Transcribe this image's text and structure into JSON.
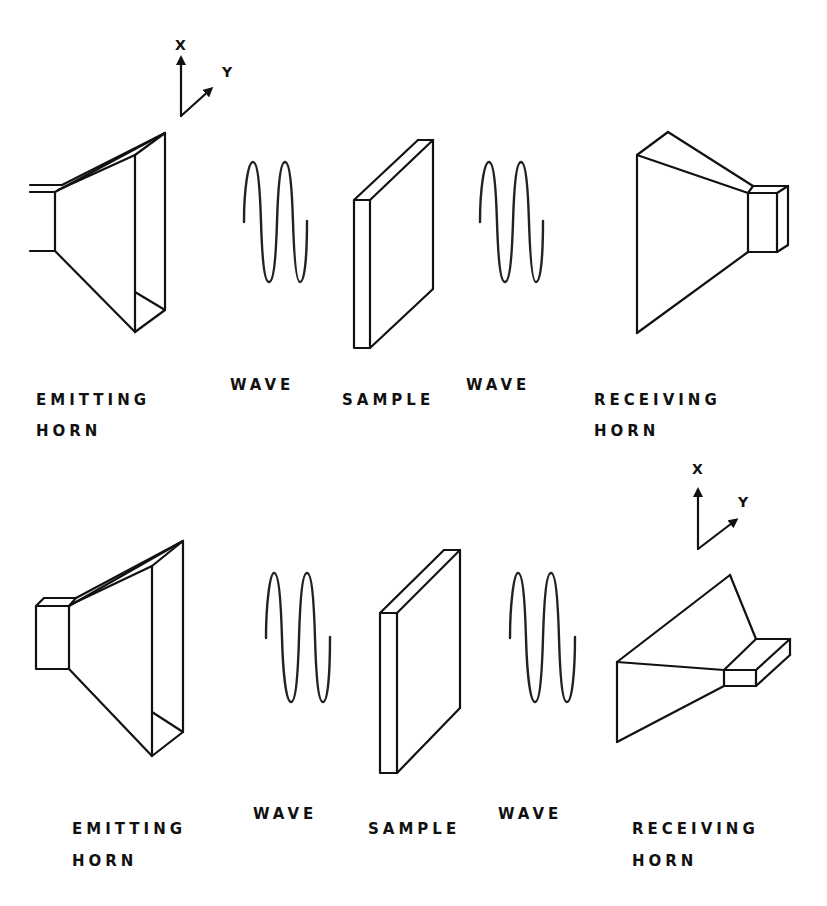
{
  "diagram": {
    "panels": [
      {
        "id": "top",
        "axis": {
          "x_label": "X",
          "y_label": "Y"
        },
        "labels": {
          "emitting_line1": "EMITTING",
          "emitting_line2": "HORN",
          "wave_left": "WAVE",
          "sample": "SAMPLE",
          "wave_right": "WAVE",
          "receiving_line1": "RECEIVING",
          "receiving_line2": "HORN"
        }
      },
      {
        "id": "bottom",
        "axis": {
          "x_label": "X",
          "y_label": "Y"
        },
        "labels": {
          "emitting_line1": "EMITTING",
          "emitting_line2": "HORN",
          "wave_left": "WAVE",
          "sample": "SAMPLE",
          "wave_right": "WAVE",
          "receiving_line1": "RECEIVING",
          "receiving_line2": "HORN"
        }
      }
    ],
    "colors": {
      "line": "#111111",
      "background": "#ffffff"
    }
  }
}
